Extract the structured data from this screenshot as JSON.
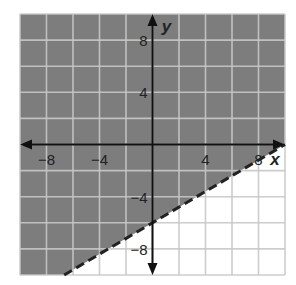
{
  "chart_data": {
    "type": "inequality-graph",
    "title": "",
    "xlabel": "x",
    "ylabel": "y",
    "xlim": [
      -10,
      10
    ],
    "ylim": [
      -10,
      10
    ],
    "grid": true,
    "grid_step": 2,
    "x_tick_labels": [
      {
        "value": -8,
        "label": "−8"
      },
      {
        "value": -4,
        "label": "−4"
      },
      {
        "value": 4,
        "label": "4"
      },
      {
        "value": 8,
        "label": "8"
      }
    ],
    "y_tick_labels": [
      {
        "value": 8,
        "label": "8"
      },
      {
        "value": 4,
        "label": "4"
      },
      {
        "value": -4,
        "label": "−4"
      },
      {
        "value": -8,
        "label": "−8"
      }
    ],
    "boundary": {
      "equation": "y = (3/5)x - 6",
      "slope": 0.6,
      "intercept": -6,
      "style": "dashed",
      "points": [
        [
          -6.67,
          -10
        ],
        [
          10,
          0
        ]
      ]
    },
    "shaded_region": "above boundary (y > (3/5)x - 6)",
    "colors": {
      "shade": "#7d7d7d",
      "grid_shaded": "#b5b5b5",
      "grid_unshaded": "#c8c8c8",
      "axis": "#111111",
      "boundary": "#222222"
    }
  }
}
